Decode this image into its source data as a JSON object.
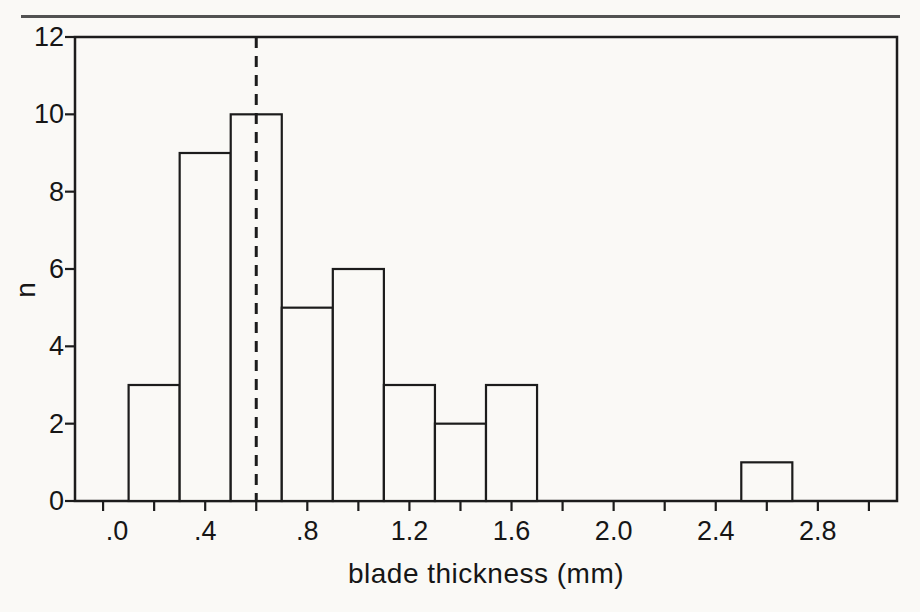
{
  "figure": {
    "kind": "scanned book histogram figure"
  },
  "chart_data": {
    "type": "bar",
    "subtype": "histogram",
    "title": "",
    "xlabel": "blade thickness (mm)",
    "ylabel": "n",
    "xlim": [
      -0.11,
      3.11
    ],
    "ylim": [
      0,
      12
    ],
    "grid": false,
    "legend": null,
    "x_major_ticks": [
      {
        "value": 0.0,
        "label": ".0",
        "dx": 14
      },
      {
        "value": 0.4,
        "label": ".4",
        "dx": 0
      },
      {
        "value": 0.8,
        "label": ".8",
        "dx": 0
      },
      {
        "value": 1.2,
        "label": "1.2",
        "dx": 0
      },
      {
        "value": 1.6,
        "label": "1.6",
        "dx": 0
      },
      {
        "value": 2.0,
        "label": "2.0",
        "dx": 0
      },
      {
        "value": 2.4,
        "label": "2.4",
        "dx": 0
      },
      {
        "value": 2.8,
        "label": "2.8",
        "dx": 0
      }
    ],
    "x_minor_ticks": {
      "start": 0.0,
      "end": 3.0,
      "step": 0.2
    },
    "y_ticks": [
      {
        "value": 0,
        "label": "0"
      },
      {
        "value": 2,
        "label": "2"
      },
      {
        "value": 4,
        "label": "4"
      },
      {
        "value": 6,
        "label": "6"
      },
      {
        "value": 8,
        "label": "8"
      },
      {
        "value": 10,
        "label": "10"
      },
      {
        "value": 12,
        "label": "12"
      }
    ],
    "bins": [
      {
        "start": 0.1,
        "end": 0.3,
        "count": 3
      },
      {
        "start": 0.3,
        "end": 0.5,
        "count": 9
      },
      {
        "start": 0.5,
        "end": 0.7,
        "count": 10
      },
      {
        "start": 0.7,
        "end": 0.9,
        "count": 5
      },
      {
        "start": 0.9,
        "end": 1.1,
        "count": 6
      },
      {
        "start": 1.1,
        "end": 1.3,
        "count": 3
      },
      {
        "start": 1.3,
        "end": 1.5,
        "count": 2
      },
      {
        "start": 1.5,
        "end": 1.7,
        "count": 3
      },
      {
        "start": 2.5,
        "end": 2.7,
        "count": 1
      }
    ],
    "reference_line": {
      "x": 0.6,
      "orientation": "vertical",
      "style": "dashed"
    },
    "colors": {
      "ink": "#1c1c1c",
      "bar_fill": "#faf9f6",
      "paper": "#faf9f6",
      "page_rule": "#525252"
    }
  }
}
